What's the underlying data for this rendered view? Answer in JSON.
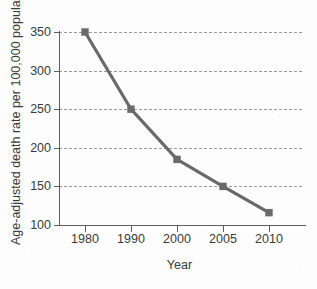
{
  "chart_data": {
    "type": "line",
    "title": "",
    "xlabel": "Year",
    "ylabel": "Age-adjusted death rate per 100,000 population",
    "categories": [
      "1980",
      "1990",
      "2000",
      "2005",
      "2010"
    ],
    "values": [
      350,
      250,
      185,
      150,
      116
    ],
    "series": [
      {
        "name": "Age-adjusted death rate",
        "values": [
          350,
          250,
          185,
          150,
          116
        ]
      }
    ],
    "ylim": [
      100,
      350
    ],
    "yticks": [
      100,
      150,
      200,
      250,
      300,
      350
    ],
    "ytick_labels": [
      "100",
      "150",
      "200",
      "250",
      "300",
      "350"
    ],
    "xtick_labels": [
      "1980",
      "1990",
      "2000",
      "2005",
      "2010"
    ],
    "grid": "horizontal-dashed",
    "legend": "none",
    "marker": "square",
    "line_color": "#6a6a6a",
    "marker_color": "#6a6a6a",
    "grid_color": "#9a9a9a",
    "axis_color": "#5d5d5d",
    "text_color": "#3a3a3a",
    "background": "#fdfdfd"
  }
}
